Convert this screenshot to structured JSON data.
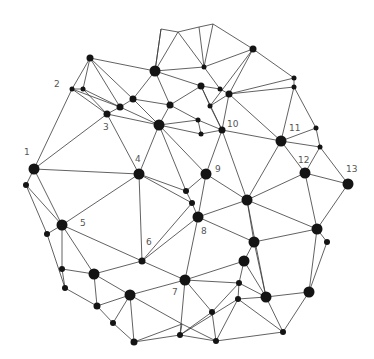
{
  "diagram": {
    "type": "network-graph",
    "width": 374,
    "height": 359,
    "colors": {
      "background": "#ffffff",
      "edge": "#3a3a3a",
      "node": "#141414",
      "label": "#555555"
    },
    "nodes": [
      {
        "id": "n1",
        "x": 34,
        "y": 169,
        "r": 5.5,
        "label": "1",
        "lx": 24,
        "ly": 155
      },
      {
        "id": "n2a",
        "x": 72,
        "y": 89,
        "r": 2.5,
        "label": "2",
        "lx": 54,
        "ly": 87
      },
      {
        "id": "n2b",
        "x": 83,
        "y": 89,
        "r": 2.5,
        "label": ""
      },
      {
        "id": "n3",
        "x": 107,
        "y": 114,
        "r": 3.5,
        "label": "3",
        "lx": 103,
        "ly": 130
      },
      {
        "id": "n4",
        "x": 139,
        "y": 174,
        "r": 5.5,
        "label": "4",
        "lx": 135,
        "ly": 162
      },
      {
        "id": "n5",
        "x": 62,
        "y": 225,
        "r": 5.5,
        "label": "5",
        "lx": 80,
        "ly": 226
      },
      {
        "id": "n6",
        "x": 142,
        "y": 261,
        "r": 3.5,
        "label": "6",
        "lx": 146,
        "ly": 245
      },
      {
        "id": "n7",
        "x": 185,
        "y": 280,
        "r": 5.5,
        "label": "7",
        "lx": 172,
        "ly": 295
      },
      {
        "id": "n8",
        "x": 198,
        "y": 217,
        "r": 5.5,
        "label": "8",
        "lx": 201,
        "ly": 234
      },
      {
        "id": "n9",
        "x": 206,
        "y": 174,
        "r": 5.5,
        "label": "9",
        "lx": 215,
        "ly": 172
      },
      {
        "id": "n10",
        "x": 222,
        "y": 130,
        "r": 3.5,
        "label": "10",
        "lx": 227,
        "ly": 127
      },
      {
        "id": "n11",
        "x": 281,
        "y": 141,
        "r": 5.5,
        "label": "11",
        "lx": 289,
        "ly": 131
      },
      {
        "id": "n12",
        "x": 305,
        "y": 173,
        "r": 5.5,
        "label": "12",
        "lx": 298,
        "ly": 163
      },
      {
        "id": "n13",
        "x": 348,
        "y": 184,
        "r": 5.5,
        "label": "13",
        "lx": 346,
        "ly": 172
      },
      {
        "id": "a1",
        "x": 90,
        "y": 58,
        "r": 3.5
      },
      {
        "id": "a2",
        "x": 155,
        "y": 71,
        "r": 5.5
      },
      {
        "id": "a3",
        "x": 133,
        "y": 99,
        "r": 3.5
      },
      {
        "id": "a4",
        "x": 120,
        "y": 107,
        "r": 3.5
      },
      {
        "id": "a5",
        "x": 170,
        "y": 105,
        "r": 3.5
      },
      {
        "id": "a6",
        "x": 159,
        "y": 125,
        "r": 5.5
      },
      {
        "id": "t1",
        "x": 161,
        "y": 29,
        "r": 0
      },
      {
        "id": "t2",
        "x": 178,
        "y": 32,
        "r": 0
      },
      {
        "id": "t3",
        "x": 199,
        "y": 27,
        "r": 0
      },
      {
        "id": "t4",
        "x": 213,
        "y": 24,
        "r": 0
      },
      {
        "id": "b1",
        "x": 204,
        "y": 67,
        "r": 2.5
      },
      {
        "id": "b2",
        "x": 253,
        "y": 49,
        "r": 3.5
      },
      {
        "id": "b3",
        "x": 201,
        "y": 86,
        "r": 3.5
      },
      {
        "id": "b4",
        "x": 220,
        "y": 89,
        "r": 2.5
      },
      {
        "id": "b5",
        "x": 229,
        "y": 94,
        "r": 3.5
      },
      {
        "id": "b6",
        "x": 210,
        "y": 106,
        "r": 2.5
      },
      {
        "id": "b7",
        "x": 294,
        "y": 78,
        "r": 2.5
      },
      {
        "id": "b8",
        "x": 294,
        "y": 87,
        "r": 2.5
      },
      {
        "id": "b9",
        "x": 198,
        "y": 120,
        "r": 2.5
      },
      {
        "id": "b10",
        "x": 201,
        "y": 134,
        "r": 2.5
      },
      {
        "id": "b11",
        "x": 316,
        "y": 128,
        "r": 2.5
      },
      {
        "id": "b12",
        "x": 320,
        "y": 147,
        "r": 2.5
      },
      {
        "id": "c1",
        "x": 26,
        "y": 185,
        "r": 3
      },
      {
        "id": "c2",
        "x": 47,
        "y": 234,
        "r": 3
      },
      {
        "id": "c3",
        "x": 186,
        "y": 191,
        "r": 3
      },
      {
        "id": "c4",
        "x": 192,
        "y": 203,
        "r": 3
      },
      {
        "id": "d1",
        "x": 62,
        "y": 269,
        "r": 3
      },
      {
        "id": "d2",
        "x": 94,
        "y": 274,
        "r": 5.5
      },
      {
        "id": "d3",
        "x": 65,
        "y": 288,
        "r": 3
      },
      {
        "id": "d4",
        "x": 130,
        "y": 295,
        "r": 5.5
      },
      {
        "id": "d5",
        "x": 97,
        "y": 306,
        "r": 3.5
      },
      {
        "id": "d6",
        "x": 113,
        "y": 323,
        "r": 3
      },
      {
        "id": "d7",
        "x": 134,
        "y": 342,
        "r": 3.5
      },
      {
        "id": "e1",
        "x": 247,
        "y": 200,
        "r": 5.5
      },
      {
        "id": "e2",
        "x": 254,
        "y": 242,
        "r": 5.5
      },
      {
        "id": "e3",
        "x": 244,
        "y": 261,
        "r": 5.5
      },
      {
        "id": "e4",
        "x": 317,
        "y": 229,
        "r": 5.5
      },
      {
        "id": "e5",
        "x": 327,
        "y": 242,
        "r": 3
      },
      {
        "id": "e6",
        "x": 239,
        "y": 283,
        "r": 3
      },
      {
        "id": "e7",
        "x": 238,
        "y": 299,
        "r": 3
      },
      {
        "id": "e8",
        "x": 266,
        "y": 297,
        "r": 5.5
      },
      {
        "id": "e9",
        "x": 309,
        "y": 292,
        "r": 5.5
      },
      {
        "id": "e10",
        "x": 212,
        "y": 312,
        "r": 3
      },
      {
        "id": "e11",
        "x": 283,
        "y": 332,
        "r": 3
      },
      {
        "id": "e12",
        "x": 216,
        "y": 341,
        "r": 3
      },
      {
        "id": "e13",
        "x": 180,
        "y": 335,
        "r": 3
      },
      {
        "id": "e14",
        "x": 182,
        "y": 324,
        "r": 0
      }
    ],
    "edges": [
      [
        "n1",
        "n2a"
      ],
      [
        "n1",
        "n3"
      ],
      [
        "n1",
        "n4"
      ],
      [
        "n1",
        "n5"
      ],
      [
        "n1",
        "c1"
      ],
      [
        "n2a",
        "a1"
      ],
      [
        "n2a",
        "n2b"
      ],
      [
        "n2a",
        "n3"
      ],
      [
        "n2a",
        "a4"
      ],
      [
        "n2b",
        "a1"
      ],
      [
        "n2b",
        "n3"
      ],
      [
        "n2b",
        "a4"
      ],
      [
        "a1",
        "a2"
      ],
      [
        "a1",
        "a4"
      ],
      [
        "a1",
        "a3"
      ],
      [
        "a2",
        "t1"
      ],
      [
        "a2",
        "t2"
      ],
      [
        "a2",
        "b1"
      ],
      [
        "a2",
        "a3"
      ],
      [
        "a2",
        "a5"
      ],
      [
        "a2",
        "b3"
      ],
      [
        "t1",
        "t2"
      ],
      [
        "t1",
        "a2"
      ],
      [
        "t2",
        "t3"
      ],
      [
        "t2",
        "b1"
      ],
      [
        "t3",
        "t4"
      ],
      [
        "t3",
        "b1"
      ],
      [
        "t4",
        "b1"
      ],
      [
        "t4",
        "b2"
      ],
      [
        "b1",
        "b2"
      ],
      [
        "b1",
        "b4"
      ],
      [
        "a3",
        "a4"
      ],
      [
        "a3",
        "a5"
      ],
      [
        "a3",
        "a6"
      ],
      [
        "a4",
        "n3"
      ],
      [
        "a4",
        "a6"
      ],
      [
        "n3",
        "a6"
      ],
      [
        "n3",
        "n4"
      ],
      [
        "a5",
        "a6"
      ],
      [
        "a5",
        "b3"
      ],
      [
        "a5",
        "b9"
      ],
      [
        "a6",
        "n4"
      ],
      [
        "a6",
        "b9"
      ],
      [
        "a6",
        "n9"
      ],
      [
        "a6",
        "c3"
      ],
      [
        "a6",
        "b10"
      ],
      [
        "b3",
        "b4"
      ],
      [
        "b3",
        "b6"
      ],
      [
        "b3",
        "n10"
      ],
      [
        "b4",
        "b5"
      ],
      [
        "b2",
        "b5"
      ],
      [
        "b2",
        "b6"
      ],
      [
        "b2",
        "b7"
      ],
      [
        "b5",
        "b6"
      ],
      [
        "b5",
        "b8"
      ],
      [
        "b5",
        "b7"
      ],
      [
        "b5",
        "n10"
      ],
      [
        "b5",
        "n11"
      ],
      [
        "b6",
        "n10"
      ],
      [
        "b7",
        "b8"
      ],
      [
        "b8",
        "n11"
      ],
      [
        "b8",
        "b11"
      ],
      [
        "b9",
        "b10"
      ],
      [
        "b10",
        "n10"
      ],
      [
        "b9",
        "n10"
      ],
      [
        "n10",
        "n11"
      ],
      [
        "n10",
        "n9"
      ],
      [
        "n10",
        "e1"
      ],
      [
        "n11",
        "b11"
      ],
      [
        "n11",
        "b12"
      ],
      [
        "n11",
        "n12"
      ],
      [
        "n11",
        "e1"
      ],
      [
        "b11",
        "b12"
      ],
      [
        "b12",
        "n12"
      ],
      [
        "b12",
        "n13"
      ],
      [
        "n12",
        "n13"
      ],
      [
        "n12",
        "e1"
      ],
      [
        "n12",
        "e4"
      ],
      [
        "n13",
        "e4"
      ],
      [
        "n4",
        "n5"
      ],
      [
        "n4",
        "n6"
      ],
      [
        "n4",
        "c3"
      ],
      [
        "n4",
        "c4"
      ],
      [
        "n9",
        "c3"
      ],
      [
        "n9",
        "n8"
      ],
      [
        "n9",
        "e1"
      ],
      [
        "c3",
        "c4"
      ],
      [
        "c4",
        "n8"
      ],
      [
        "c4",
        "n6"
      ],
      [
        "n8",
        "n6"
      ],
      [
        "n8",
        "e1"
      ],
      [
        "n8",
        "e2"
      ],
      [
        "n8",
        "n7"
      ],
      [
        "c1",
        "n5"
      ],
      [
        "c1",
        "c2"
      ],
      [
        "n5",
        "c2"
      ],
      [
        "n5",
        "d1"
      ],
      [
        "n5",
        "d2"
      ],
      [
        "n5",
        "n6"
      ],
      [
        "c2",
        "d3"
      ],
      [
        "d1",
        "d2"
      ],
      [
        "d1",
        "d3"
      ],
      [
        "d2",
        "n6"
      ],
      [
        "d2",
        "d4"
      ],
      [
        "d2",
        "d5"
      ],
      [
        "d3",
        "d5"
      ],
      [
        "d5",
        "d4"
      ],
      [
        "d5",
        "d6"
      ],
      [
        "d6",
        "d7"
      ],
      [
        "d4",
        "d6"
      ],
      [
        "d4",
        "d7"
      ],
      [
        "d4",
        "n7"
      ],
      [
        "d4",
        "e14"
      ],
      [
        "n6",
        "n7"
      ],
      [
        "n7",
        "e3"
      ],
      [
        "n7",
        "e6"
      ],
      [
        "n7",
        "e10"
      ],
      [
        "n7",
        "e13"
      ],
      [
        "e1",
        "e2"
      ],
      [
        "e1",
        "e4"
      ],
      [
        "e1",
        "e8"
      ],
      [
        "e2",
        "e3"
      ],
      [
        "e2",
        "e8"
      ],
      [
        "e2",
        "e4"
      ],
      [
        "e3",
        "e6"
      ],
      [
        "e3",
        "e8"
      ],
      [
        "e4",
        "e9"
      ],
      [
        "e4",
        "e5"
      ],
      [
        "e5",
        "e9"
      ],
      [
        "e6",
        "e7"
      ],
      [
        "e6",
        "e8"
      ],
      [
        "e6",
        "e10"
      ],
      [
        "e7",
        "e8"
      ],
      [
        "e7",
        "e11"
      ],
      [
        "e7",
        "e12"
      ],
      [
        "e7",
        "e13"
      ],
      [
        "e8",
        "e9"
      ],
      [
        "e8",
        "e11"
      ],
      [
        "e9",
        "e11"
      ],
      [
        "e10",
        "e12"
      ],
      [
        "e10",
        "e13"
      ],
      [
        "e11",
        "e12"
      ],
      [
        "e12",
        "e13"
      ],
      [
        "e13",
        "d7"
      ],
      [
        "e14",
        "e12"
      ],
      [
        "e14",
        "e13"
      ],
      [
        "d7",
        "e14"
      ]
    ]
  }
}
